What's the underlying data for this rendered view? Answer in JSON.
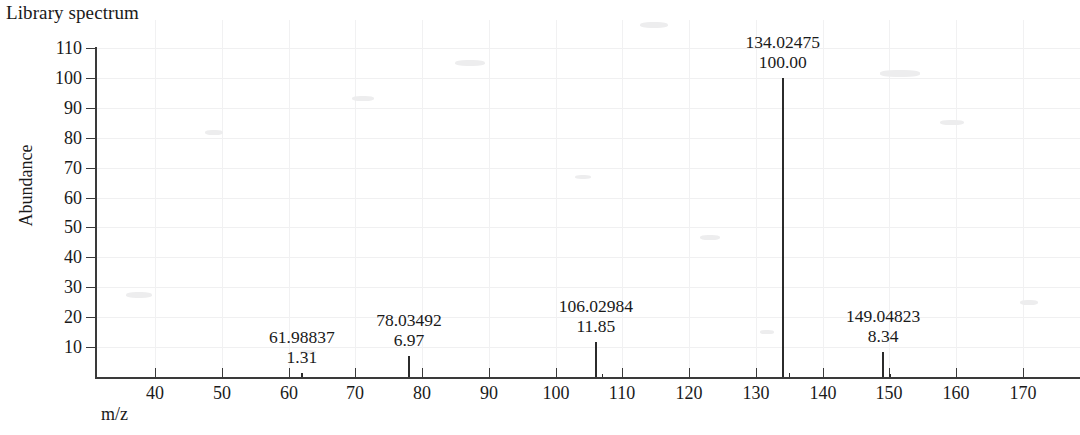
{
  "chart_data": {
    "type": "bar",
    "title": "Library spectrum",
    "xlabel": "m/z",
    "ylabel": "Abundance",
    "xlim": [
      33,
      179
    ],
    "ylim": [
      0,
      112
    ],
    "grid": true,
    "legend_position": "none",
    "x_ticks": [
      40,
      50,
      60,
      70,
      80,
      90,
      100,
      110,
      120,
      130,
      140,
      150,
      160,
      170
    ],
    "y_ticks": [
      10,
      20,
      30,
      40,
      50,
      60,
      70,
      80,
      90,
      100,
      110
    ],
    "series": [
      {
        "name": "Library spectrum",
        "peaks": [
          {
            "mz": 61.98837,
            "mz_label": "61.98837",
            "abundance": 1.31,
            "abundance_label": "1.31",
            "labeled": true
          },
          {
            "mz": 78.03492,
            "mz_label": "78.03492",
            "abundance": 6.97,
            "abundance_label": "6.97",
            "labeled": true
          },
          {
            "mz": 106.02984,
            "mz_label": "106.02984",
            "abundance": 11.85,
            "abundance_label": "11.85",
            "labeled": true
          },
          {
            "mz": 107.03,
            "mz_label": "",
            "abundance": 1.0,
            "abundance_label": "",
            "labeled": false
          },
          {
            "mz": 134.02475,
            "mz_label": "134.02475",
            "abundance": 100.0,
            "abundance_label": "100.00",
            "labeled": true
          },
          {
            "mz": 135.03,
            "mz_label": "",
            "abundance": 1.2,
            "abundance_label": "",
            "labeled": false
          },
          {
            "mz": 149.04823,
            "mz_label": "149.04823",
            "abundance": 8.34,
            "abundance_label": "8.34",
            "labeled": true
          },
          {
            "mz": 150.05,
            "mz_label": "",
            "abundance": 1.0,
            "abundance_label": "",
            "labeled": false
          }
        ]
      }
    ]
  },
  "colors": {
    "axis": "#3a3a3a",
    "peak": "#2b2b2b",
    "grid": "#f0f0f1",
    "text": "#1a1a1a",
    "background": "#ffffff"
  }
}
